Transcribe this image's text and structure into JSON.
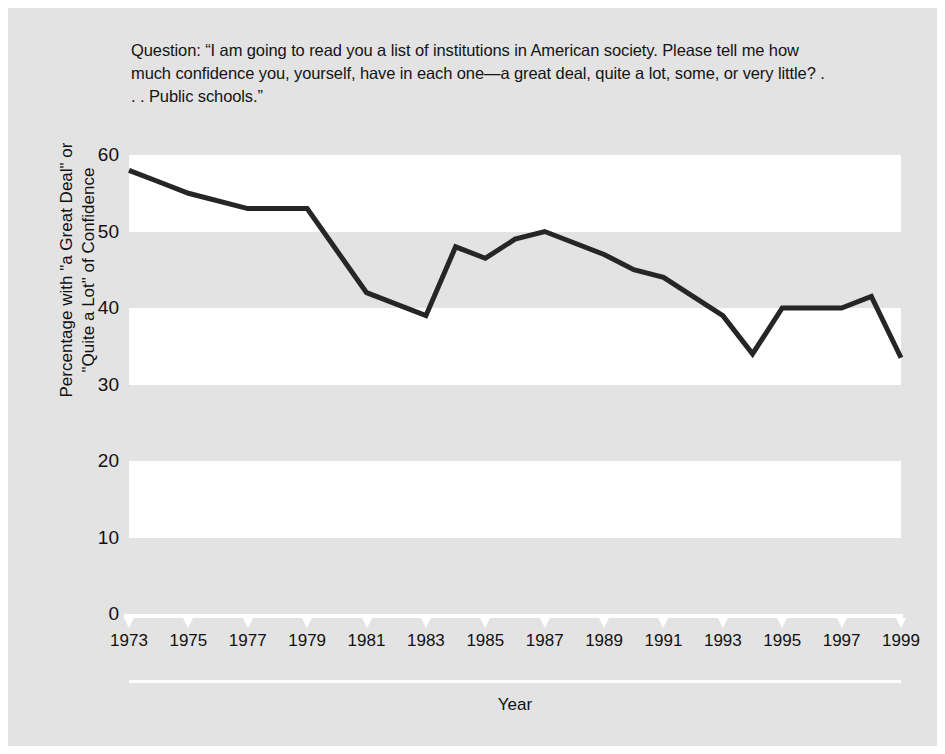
{
  "figure": {
    "background_color": "#e3e3e3",
    "band_white_color": "#ffffff",
    "line_color": "#262626",
    "text_color": "#111111"
  },
  "question": {
    "text": "Question: “I am going to read you a list of institutions in American society. Please tell me how much confidence you, yourself, have in each one—a great deal, quite a lot, some, or very little? . . . Public schools.”"
  },
  "chart_data": {
    "type": "line",
    "title": "",
    "xlabel": "Year",
    "ylabel": "Percentage with \"a Great Deal\" or \"Quite a Lot\" of Confidence",
    "xlim": [
      1973,
      1999
    ],
    "ylim": [
      0,
      60
    ],
    "yticks": [
      0,
      10,
      20,
      30,
      40,
      50,
      60
    ],
    "xticks": [
      1973,
      1975,
      1977,
      1979,
      1981,
      1983,
      1985,
      1987,
      1989,
      1991,
      1993,
      1995,
      1997,
      1999
    ],
    "grid": false,
    "banded_background": true,
    "band_ranges_white": [
      [
        50,
        60
      ],
      [
        30,
        40
      ],
      [
        10,
        20
      ]
    ],
    "legend": null,
    "series": [
      {
        "name": "Confidence in public schools",
        "x": [
          1973,
          1974,
          1975,
          1977,
          1979,
          1981,
          1983,
          1984,
          1985,
          1986,
          1987,
          1988,
          1989,
          1990,
          1991,
          1993,
          1994,
          1995,
          1996,
          1997,
          1998,
          1999
        ],
        "values": [
          58,
          56.5,
          55,
          53,
          53,
          42,
          39,
          48,
          46.5,
          49,
          50,
          48.5,
          47,
          45,
          44,
          39,
          34,
          40,
          40,
          40,
          41.5,
          33.5
        ]
      }
    ]
  },
  "y_axis": {
    "title": "Percentage with \"a Great Deal\" or",
    "title_line2": "\"Quite a Lot\" of Confidence",
    "ticks": [
      "60",
      "50",
      "40",
      "30",
      "20",
      "10",
      "0"
    ]
  },
  "x_axis": {
    "title": "Year",
    "ticks": [
      "1973",
      "1975",
      "1977",
      "1979",
      "1981",
      "1983",
      "1985",
      "1987",
      "1989",
      "1991",
      "1993",
      "1995",
      "1997",
      "1999"
    ]
  }
}
